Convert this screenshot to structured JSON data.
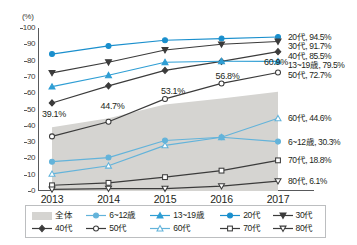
{
  "axis": {
    "unit_label": "(%)",
    "y_ticks": [
      0,
      10,
      20,
      30,
      40,
      50,
      60,
      70,
      80,
      90,
      100
    ],
    "y_min": 0,
    "y_max": 100,
    "x_categories": [
      "2013",
      "2014",
      "2015",
      "2016",
      "2017"
    ]
  },
  "colors": {
    "blue": "#2f9ed4",
    "blue_light": "#63b3da",
    "dark": "#3b3b3b",
    "area_fill": "#d5d4d1",
    "axis": "#58595b",
    "text": "#231f20"
  },
  "area_labels": [
    {
      "text": "39.1%",
      "x": 0,
      "y": 39.1
    },
    {
      "text": "44.7%",
      "x": 1,
      "y": 44.7
    },
    {
      "text": "53.1%",
      "x": 2,
      "y": 53.1
    },
    {
      "text": "56.8%",
      "x": 3,
      "y": 56.8
    },
    {
      "text": "60.9%",
      "x": 4,
      "y": 60.9
    }
  ],
  "end_labels": [
    {
      "name": "20代",
      "text": "20代, 94.5%",
      "value": 94.5
    },
    {
      "name": "30代",
      "text": "30代, 91.7%",
      "value": 91.7
    },
    {
      "name": "40代",
      "text": "40代, 85.5%",
      "value": 85.5
    },
    {
      "name": "13~19歳",
      "text": "13~19歳, 79.5%",
      "value": 79.5
    },
    {
      "name": "50代",
      "text": "50代, 72.7%",
      "value": 72.7
    },
    {
      "name": "60代",
      "text": "60代, 44.6%",
      "value": 44.6
    },
    {
      "name": "6~12歳",
      "text": "6~12歳, 30.3%",
      "value": 30.3
    },
    {
      "name": "70代",
      "text": "70代, 18.8%",
      "value": 18.8
    },
    {
      "name": "80代",
      "text": "80代, 6.1%",
      "value": 6.1
    }
  ],
  "legend": {
    "row1": [
      {
        "label": "全体",
        "marker": "area",
        "color": "#d5d4d1"
      },
      {
        "label": "6~12歳",
        "marker": "circle-filled",
        "color": "#63b3da"
      },
      {
        "label": "13~19歳",
        "marker": "triangle-filled",
        "color": "#2f9ed4"
      },
      {
        "label": "20代",
        "marker": "circle-filled",
        "color": "#1a8fcd"
      },
      {
        "label": "30代",
        "marker": "triangle-down-filled",
        "color": "#3b3b3b"
      }
    ],
    "row2": [
      {
        "label": "40代",
        "marker": "diamond-filled",
        "color": "#3b3b3b"
      },
      {
        "label": "50代",
        "marker": "circle-open",
        "color": "#3b3b3b"
      },
      {
        "label": "60代",
        "marker": "triangle-open",
        "color": "#63b3da"
      },
      {
        "label": "70代",
        "marker": "square-open",
        "color": "#3b3b3b"
      },
      {
        "label": "80代",
        "marker": "triangle-down-open",
        "color": "#3b3b3b"
      }
    ]
  },
  "chart_data": {
    "type": "line",
    "title": "",
    "subtitle": "",
    "xlabel": "",
    "ylabel": "(%)",
    "ylim": [
      0,
      100
    ],
    "grid": false,
    "legend_position": "bottom",
    "categories": [
      "2013",
      "2014",
      "2015",
      "2016",
      "2017"
    ],
    "area_series": {
      "name": "全体",
      "type": "area",
      "color": "#d5d4d1",
      "values": [
        39.1,
        44.7,
        53.1,
        56.8,
        60.9
      ],
      "labels": [
        "39.1%",
        "44.7%",
        "53.1%",
        "56.8%",
        "60.9%"
      ]
    },
    "series": [
      {
        "name": "20代",
        "color": "#1a8fcd",
        "marker": "circle-filled",
        "values": [
          84.0,
          89.0,
          92.5,
          93.5,
          94.5
        ],
        "end_label": "20代, 94.5%"
      },
      {
        "name": "30代",
        "color": "#3b3b3b",
        "marker": "triangle-down-filled",
        "values": [
          72.5,
          79.0,
          86.5,
          90.0,
          91.7
        ],
        "end_label": "30代, 91.7%"
      },
      {
        "name": "40代",
        "color": "#3b3b3b",
        "marker": "diamond-filled",
        "values": [
          54.0,
          64.5,
          74.0,
          79.5,
          85.5
        ],
        "end_label": "40代, 85.5%"
      },
      {
        "name": "13~19歳",
        "color": "#2f9ed4",
        "marker": "triangle-filled",
        "values": [
          64.0,
          71.0,
          79.0,
          79.6,
          79.5
        ],
        "end_label": "13~19歳, 79.5%"
      },
      {
        "name": "50代",
        "color": "#3b3b3b",
        "marker": "circle-open",
        "values": [
          33.5,
          42.5,
          56.5,
          66.0,
          72.7
        ],
        "end_label": "50代, 72.7%"
      },
      {
        "name": "60代",
        "color": "#63b3da",
        "marker": "triangle-open",
        "values": [
          10.5,
          15.5,
          28.0,
          33.0,
          44.6
        ],
        "end_label": "60代, 44.6%"
      },
      {
        "name": "6~12歳",
        "color": "#63b3da",
        "marker": "circle-filled",
        "values": [
          18.0,
          20.5,
          31.0,
          33.0,
          30.3
        ],
        "end_label": "6~12歳, 30.3%"
      },
      {
        "name": "70代",
        "color": "#3b3b3b",
        "marker": "square-open",
        "values": [
          3.5,
          5.0,
          8.5,
          12.5,
          18.8
        ],
        "end_label": "70代, 18.8%"
      },
      {
        "name": "80代",
        "color": "#3b3b3b",
        "marker": "triangle-down-open",
        "values": [
          1.0,
          1.5,
          1.5,
          3.0,
          6.1
        ],
        "end_label": "80代, 6.1%"
      }
    ]
  }
}
